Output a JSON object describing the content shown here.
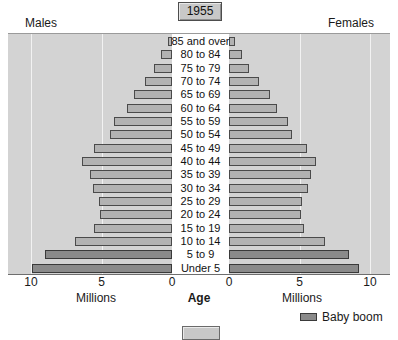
{
  "year_badge": {
    "label": "1955"
  },
  "headings": {
    "males": "Males",
    "females": "Females"
  },
  "axis": {
    "left_title": "Millions",
    "right_title": "Millions",
    "center_title": "Age",
    "left_ticks": [
      "10",
      "5",
      "0"
    ],
    "right_ticks": [
      "0",
      "5",
      "10"
    ]
  },
  "legend": {
    "items": [
      {
        "label": "Baby boom",
        "color": "#8a8a8a"
      }
    ]
  },
  "colors": {
    "bar": "#b2b2b2",
    "bar_border": "#4a4a4a",
    "baby_boom": "#8a8a8a",
    "plot_background": "#d3d3d3",
    "gridline": "#f2f2f2",
    "badge": "#c8c8c8"
  },
  "chart_data": {
    "type": "bar",
    "title": "1955",
    "subtitle": "",
    "xlabel": "Millions",
    "ylabel": "Age",
    "orientation": "horizontal",
    "layout": "population-pyramid",
    "xlim": [
      0,
      10
    ],
    "grid": true,
    "gridlines_at": [
      5,
      10
    ],
    "legend_position": "bottom-right",
    "categories": [
      "85 and over",
      "80 to 84",
      "75 to 79",
      "70 to 74",
      "65 to 69",
      "60 to 64",
      "55 to 59",
      "50 to 54",
      "45 to 49",
      "40 to 44",
      "35 to 39",
      "30 to 34",
      "25 to 29",
      "20 to 24",
      "15 to 19",
      "10 to 14",
      "5 to 9",
      "Under 5"
    ],
    "series": [
      {
        "name": "Males",
        "side": "left",
        "values": [
          0.3,
          0.8,
          1.3,
          1.9,
          2.7,
          3.2,
          4.1,
          4.4,
          5.5,
          6.4,
          5.8,
          5.6,
          5.2,
          5.1,
          5.5,
          6.9,
          9.0,
          9.9
        ]
      },
      {
        "name": "Females",
        "side": "right",
        "values": [
          0.4,
          0.9,
          1.4,
          2.1,
          2.9,
          3.4,
          4.2,
          4.5,
          5.5,
          6.2,
          5.8,
          5.6,
          5.2,
          5.1,
          5.3,
          6.8,
          8.5,
          9.2
        ]
      }
    ],
    "highlight": {
      "label": "Baby boom",
      "categories": [
        "5 to 9",
        "Under 5"
      ]
    }
  }
}
